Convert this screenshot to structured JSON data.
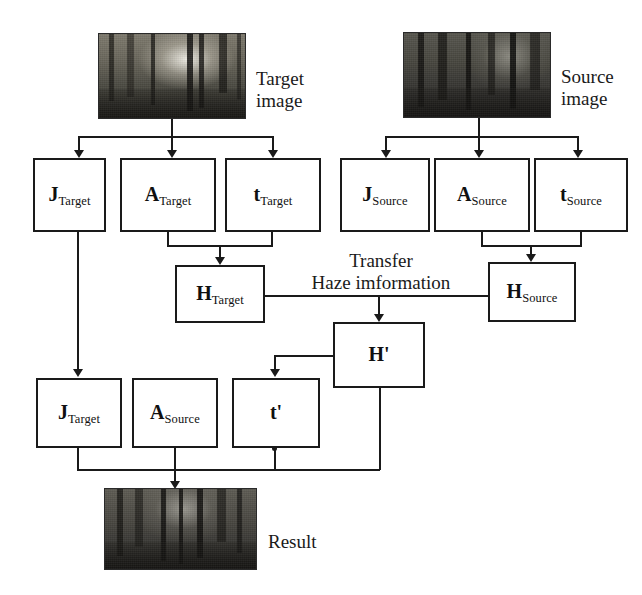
{
  "diagram": {
    "ink_color": "#1a1a1a",
    "background_color": "#ffffff",
    "captions": {
      "target_image": "Target\nimage",
      "source_image": "Source\nimage",
      "transfer": "Transfer\nHaze imformation",
      "result": "Result"
    },
    "images": [
      {
        "id": "target-image",
        "caption": "Target image",
        "description": "misty forest photo, bright hazy center"
      },
      {
        "id": "source-image",
        "caption": "Source image",
        "description": "dark forest photo, low haze"
      },
      {
        "id": "result-image",
        "caption": "Result",
        "description": "forest photo after haze transfer"
      }
    ],
    "boxes": [
      {
        "id": "j-target-top",
        "main": "J",
        "sub": "Target"
      },
      {
        "id": "a-target",
        "main": "A",
        "sub": "Target"
      },
      {
        "id": "t-target",
        "main": "t",
        "sub": "Target"
      },
      {
        "id": "j-source",
        "main": "J",
        "sub": "Source"
      },
      {
        "id": "a-source-top",
        "main": "A",
        "sub": "Source"
      },
      {
        "id": "t-source",
        "main": "t",
        "sub": "Source"
      },
      {
        "id": "h-target",
        "main": "H",
        "sub": "Target"
      },
      {
        "id": "h-source",
        "main": "H",
        "sub": "Source"
      },
      {
        "id": "h-prime",
        "main": "H'",
        "sub": ""
      },
      {
        "id": "j-target-bot",
        "main": "J",
        "sub": "Target"
      },
      {
        "id": "a-source-bot",
        "main": "A",
        "sub": "Source"
      },
      {
        "id": "t-prime",
        "main": "t'",
        "sub": ""
      }
    ]
  }
}
